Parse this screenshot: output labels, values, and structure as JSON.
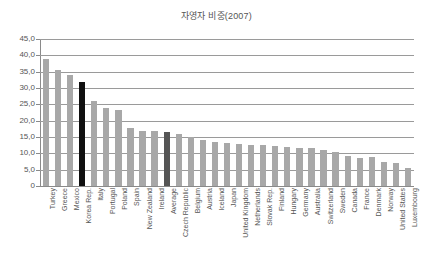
{
  "chart_data": {
    "type": "bar",
    "title": "자영자 비중(2007)",
    "xlabel": "",
    "ylabel": "",
    "ylim": [
      0,
      45
    ],
    "ytick_labels": [
      "45,0",
      "40,0",
      "35,0",
      "30,0",
      "25,0",
      "20,0",
      "15,0",
      "10,0",
      "5,0",
      "0"
    ],
    "ytick_values": [
      45,
      40,
      35,
      30,
      25,
      20,
      15,
      10,
      5,
      0
    ],
    "grid": true,
    "legend": "none",
    "categories": [
      "Turkey",
      "Greece",
      "Mexico",
      "Korea Rep.",
      "Italy",
      "Portugal",
      "Poland",
      "Spain",
      "New Zealand",
      "Ireland",
      "Average",
      "Czech Republic",
      "Belgium",
      "Austria",
      "Iceland",
      "Japan",
      "United Kingdom",
      "Netherlands",
      "Slovak Rep.",
      "Finland",
      "Hungary",
      "Germany",
      "Australia",
      "Switzerland",
      "Sweden",
      "Canada",
      "France",
      "Denmark",
      "Norway",
      "United States",
      "Luxembourg"
    ],
    "values": [
      39.0,
      35.5,
      34.0,
      31.8,
      26.0,
      23.8,
      23.2,
      17.7,
      16.7,
      16.7,
      16.4,
      15.9,
      14.9,
      14.2,
      13.5,
      13.1,
      13.0,
      12.5,
      12.5,
      12.2,
      12.0,
      11.5,
      11.5,
      11.0,
      10.5,
      9.2,
      8.6,
      8.8,
      7.4,
      7.0,
      5.4
    ],
    "bar_styles": [
      "normal",
      "normal",
      "normal",
      "highlight-dark",
      "normal",
      "normal",
      "normal",
      "normal",
      "normal",
      "normal",
      "highlight-mid",
      "normal",
      "normal",
      "normal",
      "normal",
      "normal",
      "normal",
      "normal",
      "normal",
      "normal",
      "normal",
      "normal",
      "normal",
      "normal",
      "normal",
      "normal",
      "normal",
      "normal",
      "normal",
      "normal",
      "normal"
    ],
    "colors": {
      "bar_normal": "#a8a8a8",
      "bar_highlight_dark": "#101010",
      "bar_highlight_mid": "#555555",
      "gridline": "#9a9a9a",
      "axis": "#8a8a8a",
      "text": "#555555",
      "background": "#ffffff"
    }
  }
}
